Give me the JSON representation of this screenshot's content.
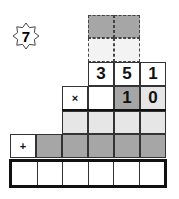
{
  "badge": {
    "number": "7",
    "icon": "eight-point-star-icon"
  },
  "colors": {
    "dark_gray": "#a6a6a6",
    "light_gray": "#e6e6e6",
    "very_light": "#f3f3f3",
    "white": "#ffffff",
    "line": "#333333"
  },
  "multiplicand": [
    "3",
    "5",
    "1"
  ],
  "multiplier": {
    "operator": "×",
    "digits": [
      "",
      "1",
      "0"
    ]
  },
  "addition": {
    "operator": "+"
  },
  "result_cells": 6
}
